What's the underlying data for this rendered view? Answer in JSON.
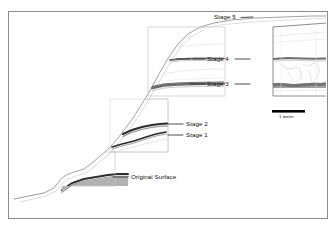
{
  "figure": {
    "kind": "archaeological-mound-profile",
    "background": "#ffffff",
    "frame": {
      "name": "figure-border",
      "x": 8,
      "y": 11,
      "width": 319,
      "height": 207,
      "stroke": "#8a8a8a",
      "stroke_width": 1
    },
    "colors": {
      "outline": "#6e6e6e",
      "faint_outline": "#b8b8b8",
      "fill_light": "#ffffff",
      "fill_mid_gray": "#b9b9b9",
      "fill_dark_gray": "#9a9a9a",
      "band_dark": "#2a2a2a",
      "band_medium": "#6b6b6b",
      "band_soft": "#8f8f8f",
      "label_text": "#101010",
      "leader_line": "#2a2a2a",
      "scalebar": "#000000"
    }
  },
  "labels": [
    {
      "id": "stage5",
      "text": "Stage 5",
      "x": 214,
      "y": 17,
      "anchor": "start",
      "leader": {
        "side": "right",
        "x1": 240,
        "y1": 20,
        "x2": 253,
        "y2": 20
      }
    },
    {
      "id": "stage4",
      "text": "Stage 4",
      "x": 208,
      "y": 56,
      "anchor": "start",
      "leader_left": {
        "x1": 193,
        "y1": 59,
        "x2": 205,
        "y2": 59
      },
      "leader_right": {
        "x1": 234,
        "y1": 59,
        "x2": 248,
        "y2": 59
      },
      "tick_left": {
        "x1": 174,
        "y1": 59,
        "x2": 190,
        "y2": 59
      }
    },
    {
      "id": "stage3",
      "text": "Stage 3",
      "x": 208,
      "y": 81,
      "anchor": "start",
      "leader_left": {
        "x1": 192,
        "y1": 84,
        "x2": 205,
        "y2": 84
      },
      "leader_right": {
        "x1": 234,
        "y1": 84,
        "x2": 248,
        "y2": 84
      }
    },
    {
      "id": "stage2",
      "text": "Stage 2",
      "x": 186,
      "y": 121,
      "anchor": "start",
      "leader_left": {
        "x1": 168,
        "y1": 124,
        "x2": 183,
        "y2": 124
      }
    },
    {
      "id": "stage1",
      "text": "Stage 1",
      "x": 186,
      "y": 132,
      "anchor": "start",
      "leader_left": {
        "x1": 168,
        "y1": 135,
        "x2": 183,
        "y2": 135
      }
    },
    {
      "id": "original-surface",
      "text": "Original Surface",
      "x": 131,
      "y": 174,
      "anchor": "start",
      "leader_left": {
        "x1": 113,
        "y1": 177,
        "x2": 128,
        "y2": 177
      }
    }
  ],
  "scalebar": {
    "name": "scale-bar",
    "label": "1 meter",
    "bar": {
      "x": 272,
      "y": 110,
      "width": 33,
      "height": 2.6
    },
    "label_x": 280,
    "label_y": 118
  },
  "inset": {
    "name": "inset-detail-box",
    "x": 273,
    "y": 23,
    "width": 54,
    "height": 73,
    "stroke": "#6e6e6e"
  },
  "excavation_units": [
    {
      "name": "unit-upper",
      "points": "148,96 225,96 225,27 168,27"
    },
    {
      "name": "unit-middle",
      "points": "110,150 168,150 168,96 148,96"
    },
    {
      "name": "unit-lower",
      "points": "72,186 115,186 115,150 110,150"
    }
  ],
  "profile": {
    "mound_outline": "M 14,210 L 14,199 L 50,186 L 61,182 L 70,174 L 78,168 L 86,162 L 92,152 L 100,146 L 108,140 L 116,132 L 122,124 L 130,116 L 138,106 L 146,96 L 152,86 L 160,72 L 168,58 L 176,44 L 186,34 L 196,28 L 210,24 L 226,21 L 250,19 L 272,18 L 300,17 L 326,16",
    "original_surface": "M 14,199 L 40,195 L 52,190 L 58,182 L 64,178 L 70,176 L 80,175 L 92,174 L 104,172 L 114,170",
    "note": "stepped terrace base with gray fills and dark stratigraphic bands"
  },
  "strata_bands": [
    {
      "name": "band-stage1",
      "color": "#2a2a2a",
      "thickness": 1.4
    },
    {
      "name": "band-stage2",
      "color": "#2a2a2a",
      "thickness": 1.8
    },
    {
      "name": "band-stage3",
      "color": "#6b6b6b",
      "thickness": 2.0
    },
    {
      "name": "band-stage4",
      "color": "#6b6b6b",
      "thickness": 1.6
    },
    {
      "name": "band-original",
      "color": "#2a2a2a",
      "thickness": 1.6
    }
  ]
}
